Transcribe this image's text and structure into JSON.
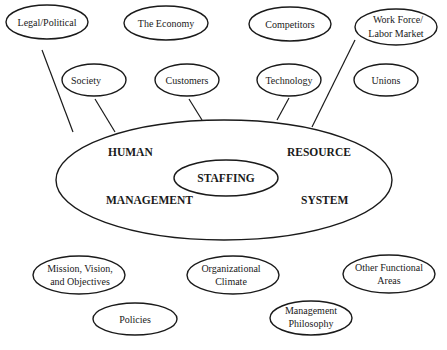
{
  "diagram": {
    "central": {
      "outer_quadrants": {
        "top_left": "HUMAN",
        "top_right": "RESOURCE",
        "bottom_left": "MANAGEMENT",
        "bottom_right": "SYSTEM"
      },
      "inner": "STAFFING"
    },
    "external_environment": [
      {
        "id": "legal",
        "lines": [
          "Legal/Political"
        ],
        "connected": true
      },
      {
        "id": "economy",
        "lines": [
          "The Economy"
        ],
        "connected": false
      },
      {
        "id": "competitors",
        "lines": [
          "Competitors"
        ],
        "connected": false
      },
      {
        "id": "workforce",
        "lines": [
          "Work Force/",
          "Labor Market"
        ],
        "connected": true
      },
      {
        "id": "society",
        "lines": [
          "Society"
        ],
        "connected": true
      },
      {
        "id": "customers",
        "lines": [
          "Customers"
        ],
        "connected": true
      },
      {
        "id": "technology",
        "lines": [
          "Technology"
        ],
        "connected": true
      },
      {
        "id": "unions",
        "lines": [
          "Unions"
        ],
        "connected": false
      }
    ],
    "internal_environment": [
      {
        "id": "mission",
        "lines": [
          "Mission, Vision,",
          "and Objectives"
        ]
      },
      {
        "id": "climate",
        "lines": [
          "Organizational",
          "Climate"
        ]
      },
      {
        "id": "other",
        "lines": [
          "Other Functional",
          "Areas"
        ]
      },
      {
        "id": "policies",
        "lines": [
          "Policies"
        ]
      },
      {
        "id": "philosophy",
        "lines": [
          "Management",
          "Philosophy"
        ]
      }
    ]
  }
}
